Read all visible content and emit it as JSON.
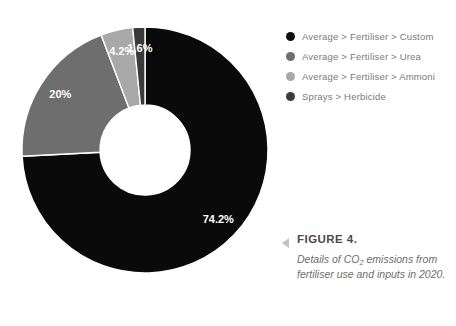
{
  "chart_data": {
    "type": "pie",
    "variant": "donut",
    "title": "",
    "xlabel": "",
    "ylabel": "",
    "legend_position": "right-top",
    "grid": false,
    "unit": "%",
    "categories": [
      "Average > Fertiliser > Custom",
      "Average > Fertiliser > Urea",
      "Average > Fertiliser > Ammoni",
      "Sprays > Herbicide"
    ],
    "values": [
      74.2,
      20,
      4.2,
      1.6
    ],
    "labels": [
      "74.2%",
      "20%",
      "4.2%",
      "1.6%"
    ],
    "colors": [
      "#0a0a0a",
      "#6e6e6e",
      "#a8a8a8",
      "#3a3a3a"
    ],
    "slices": [
      {
        "name": "Average > Fertiliser > Custom",
        "value": 74.2,
        "label": "74.2%",
        "color": "#0a0a0a"
      },
      {
        "name": "Average > Fertiliser > Urea",
        "value": 20,
        "label": "20%",
        "color": "#6e6e6e"
      },
      {
        "name": "Average > Fertiliser > Ammoni",
        "value": 4.2,
        "label": "4.2%",
        "color": "#a8a8a8"
      },
      {
        "name": "Sprays > Herbicide",
        "value": 1.6,
        "label": "1.6%",
        "color": "#3a3a3a"
      }
    ]
  },
  "legend": {
    "items": [
      {
        "label": "Average > Fertiliser > Custom",
        "color": "#0f0f0f"
      },
      {
        "label": "Average > Fertiliser > Urea",
        "color": "#6e6e6e"
      },
      {
        "label": "Average > Fertiliser > Ammoni",
        "color": "#a8a8a8"
      },
      {
        "label": "Sprays > Herbicide",
        "color": "#3c3c3c"
      }
    ]
  },
  "caption": {
    "title": "FIGURE 4.",
    "description_line1": "Details of CO",
    "description_subscript": "2",
    "description_line2": " emissions from fertiliser use and inputs in 2020."
  }
}
